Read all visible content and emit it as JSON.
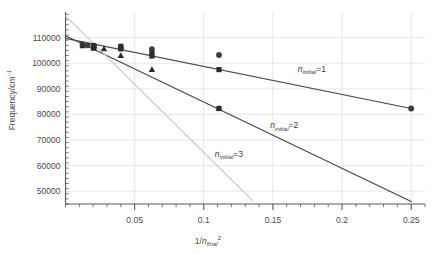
{
  "chart_data": {
    "type": "scatter",
    "title": "",
    "xlabel": "1/n_final^2",
    "ylabel": "Frequency/cm^-1",
    "xlabel_parts": {
      "pre": "1/",
      "var": "n",
      "sub": "final",
      "sup": "2"
    },
    "ylabel_parts": {
      "pre": "Frequency/cm",
      "sup": "−1"
    },
    "xlim": [
      0,
      0.26
    ],
    "ylim": [
      45000,
      120000
    ],
    "xticks": [
      0.05,
      0.1,
      0.15,
      0.2,
      0.25
    ],
    "xtick_labels": [
      "0.05",
      "0.1",
      "0.15",
      "0.2",
      "0.25"
    ],
    "x_minor_count": 4,
    "yticks": [
      50000,
      60000,
      70000,
      80000,
      90000,
      100000,
      110000
    ],
    "ytick_labels": [
      "50000",
      "60000",
      "70000",
      "80000",
      "90000",
      "100000",
      "110000"
    ],
    "y_minor_count": 4,
    "grid": true,
    "grid_color": "#e2e2e6",
    "legend": "inline-annotations",
    "series": [
      {
        "name": "n_initial=1",
        "label_parts": {
          "var": "n",
          "sub": "initial",
          "eq": "=1"
        },
        "marker": "circle",
        "color": "#3d3d3d",
        "line_color": "#4a4a4a",
        "label_x": 0.168,
        "label_y": 96500,
        "fit_line": {
          "x0": 0.0,
          "y0": 109700,
          "x1": 0.25,
          "y1": 82300
        },
        "points": [
          {
            "x": 0.0123,
            "y": 107300
          },
          {
            "x": 0.016,
            "y": 107000
          },
          {
            "x": 0.0204,
            "y": 106900
          },
          {
            "x": 0.0204,
            "y": 106500
          },
          {
            "x": 0.04,
            "y": 106000
          },
          {
            "x": 0.0625,
            "y": 105500
          },
          {
            "x": 0.111,
            "y": 103200
          },
          {
            "x": 0.25,
            "y": 82300
          }
        ]
      },
      {
        "name": "n_initial=2",
        "label_parts": {
          "var": "n",
          "sub": "initial",
          "eq": "=2"
        },
        "marker": "square",
        "color": "#2e2e2e",
        "line_color": "#4a4a4a",
        "label_x": 0.148,
        "label_y": 74500,
        "fit_line": {
          "x0": 0.0,
          "y0": 110700,
          "x1": 0.25,
          "y1": 46000
        },
        "points": [
          {
            "x": 0.0204,
            "y": 106800
          },
          {
            "x": 0.0204,
            "y": 106300
          },
          {
            "x": 0.04,
            "y": 106600
          },
          {
            "x": 0.04,
            "y": 105600
          },
          {
            "x": 0.0625,
            "y": 104000
          },
          {
            "x": 0.0625,
            "y": 102800
          },
          {
            "x": 0.111,
            "y": 97500
          },
          {
            "x": 0.111,
            "y": 82300
          }
        ]
      },
      {
        "name": "n_initial=3",
        "label_parts": {
          "var": "n",
          "sub": "initial",
          "eq": "=3"
        },
        "marker": "triangle",
        "color": "#2b2b2b",
        "line_color": "#c9c9c9",
        "label_x": 0.108,
        "label_y": 63500,
        "fit_line": {
          "x0": 0.0,
          "y0": 118500,
          "x1": 0.1355,
          "y1": 46200
        },
        "points": [
          {
            "x": 0.0123,
            "y": 106900
          },
          {
            "x": 0.0204,
            "y": 106400
          },
          {
            "x": 0.0204,
            "y": 105900
          },
          {
            "x": 0.0278,
            "y": 105700
          },
          {
            "x": 0.04,
            "y": 103000
          },
          {
            "x": 0.0625,
            "y": 97600
          },
          {
            "x": 0.111,
            "y": 82400
          }
        ]
      }
    ]
  }
}
